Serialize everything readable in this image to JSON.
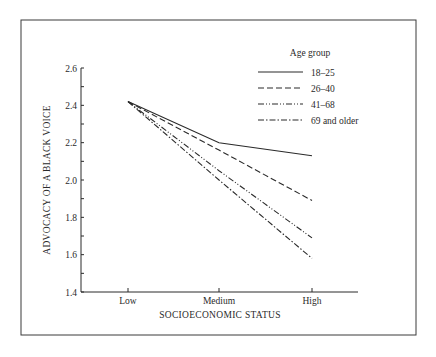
{
  "chart_data": {
    "type": "line",
    "title": "",
    "xlabel": "SOCIOECONOMIC STATUS",
    "ylabel": "ADVOCACY OF A BLACK VOICE",
    "categories": [
      "Low",
      "Medium",
      "High"
    ],
    "yticks": [
      "1.4",
      "1.6",
      "1.8",
      "2.0",
      "2.2",
      "2.4",
      "2.6"
    ],
    "ylim": [
      1.4,
      2.6
    ],
    "grid": false,
    "legend_title": "Age group",
    "legend_position": "upper right",
    "series": [
      {
        "name": "18–25",
        "style": "solid",
        "values": [
          2.42,
          2.2,
          2.13
        ]
      },
      {
        "name": "26–40",
        "style": "dashed",
        "values": [
          2.42,
          2.16,
          1.89
        ]
      },
      {
        "name": "41–68",
        "style": "dash-dot-dot",
        "values": [
          2.42,
          2.05,
          1.69
        ]
      },
      {
        "name": "69 and older",
        "style": "dash-dot",
        "values": [
          2.42,
          2.0,
          1.58
        ]
      }
    ]
  }
}
